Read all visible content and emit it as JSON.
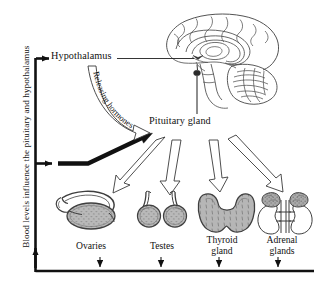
{
  "diagram": {
    "background_color": "#ffffff",
    "line_color": "#111111",
    "organ_fill_color": "#b4b4b4",
    "arrow_fill_color": "#ffffff",
    "feedback_caption": "Blood levels influence the pituitary and hypothalamus",
    "nodes": {
      "hypothalamus": "Hypothalamus",
      "pituitary": "Pituitary gland",
      "releasing_hormones": "Releasing hormones"
    },
    "organs": [
      {
        "id": "ovaries",
        "line1": "Ovaries",
        "line2": ""
      },
      {
        "id": "testes",
        "line1": "Testes",
        "line2": ""
      },
      {
        "id": "thyroid",
        "line1": "Thyroid",
        "line2": "gland"
      },
      {
        "id": "adrenal",
        "line1": "Adrenal",
        "line2": "glands"
      }
    ]
  }
}
